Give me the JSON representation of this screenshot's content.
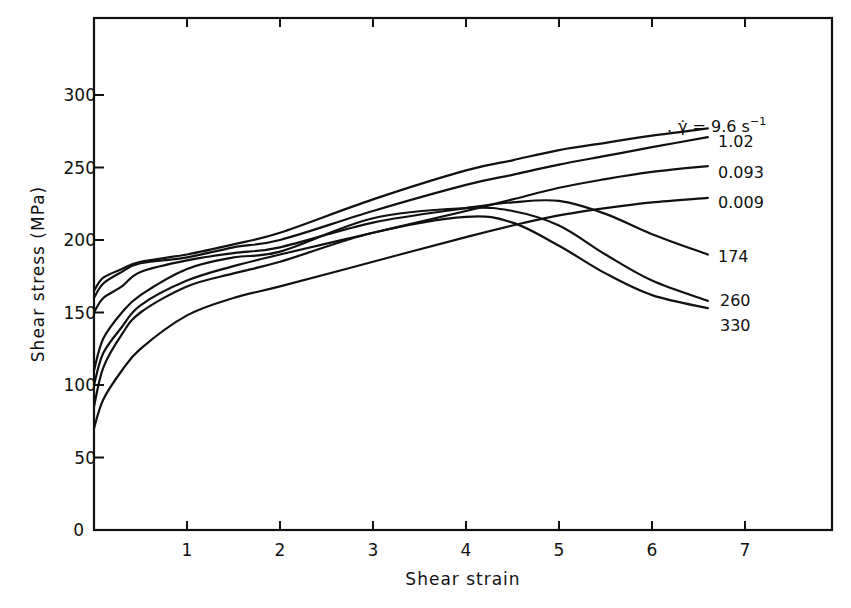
{
  "chart_data": {
    "type": "line",
    "title": "",
    "xlabel": "Shear strain",
    "ylabel": "Shear stress (MPa)",
    "xlim": [
      0,
      7.9
    ],
    "ylim": [
      0,
      350
    ],
    "x_ticks": [
      1,
      2,
      3,
      4,
      5,
      6,
      7
    ],
    "y_ticks": [
      0,
      50,
      100,
      150,
      200,
      250,
      300
    ],
    "grid": false,
    "legend_position": "inline labels at right end of curves",
    "legend_title": "γ̇ =",
    "legend_unit": "s⁻¹",
    "x": [
      0,
      0.1,
      0.3,
      0.5,
      1,
      1.5,
      2,
      3,
      4,
      4.5,
      5,
      5.5,
      6,
      6.6
    ],
    "series": [
      {
        "name": "9.6",
        "label": "γ̇ = 9.6 s⁻¹",
        "values": [
          165,
          174,
          180,
          185,
          190,
          197,
          205,
          228,
          248,
          255,
          262,
          267,
          272,
          277
        ]
      },
      {
        "name": "1.02",
        "label": "1.02",
        "values": [
          160,
          170,
          178,
          184,
          188,
          195,
          200,
          220,
          238,
          245,
          252,
          258,
          264,
          271
        ]
      },
      {
        "name": "0.093",
        "label": "0.093",
        "values": [
          100,
          122,
          140,
          155,
          172,
          182,
          190,
          205,
          220,
          228,
          236,
          242,
          247,
          251
        ]
      },
      {
        "name": "0.009",
        "label": "0.009",
        "values": [
          70,
          90,
          110,
          125,
          148,
          160,
          168,
          185,
          202,
          210,
          217,
          222,
          226,
          229
        ]
      },
      {
        "name": "174",
        "label": "174",
        "values": [
          150,
          160,
          168,
          178,
          186,
          191,
          195,
          212,
          222,
          226,
          227,
          218,
          204,
          190
        ]
      },
      {
        "name": "260",
        "label": "260",
        "values": [
          110,
          132,
          150,
          162,
          180,
          188,
          192,
          215,
          222,
          220,
          210,
          190,
          172,
          158
        ]
      },
      {
        "name": "330",
        "label": "330",
        "values": [
          85,
          112,
          135,
          150,
          168,
          177,
          185,
          205,
          216,
          212,
          196,
          177,
          162,
          153
        ]
      }
    ]
  },
  "labels": {
    "xlabel": "Shear strain",
    "ylabel": "Shear stress (MPa)",
    "legend_prefix": "γ̇ = 9.6 s",
    "legend_sup": "−1",
    "y_tick_labels": [
      "0",
      "50",
      "100",
      "150",
      "200",
      "250",
      "300"
    ],
    "x_tick_labels": [
      "1",
      "2",
      "3",
      "4",
      "5",
      "6",
      "7"
    ],
    "series_labels": [
      "1.02",
      "0.093",
      "0.009",
      "174",
      "260",
      "330"
    ]
  },
  "style": {
    "line_color": "#111111",
    "background": "#ffffff"
  }
}
